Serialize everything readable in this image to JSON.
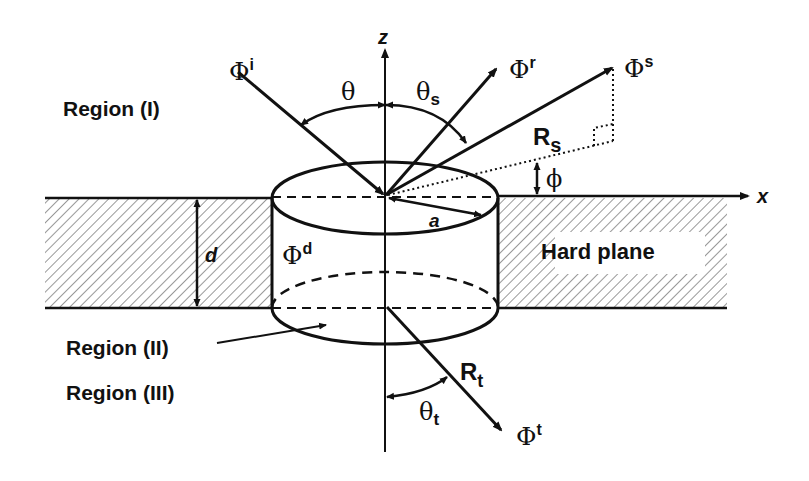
{
  "diagram": {
    "regions": {
      "upper": "Region (I)",
      "middle": "Region (II)",
      "lower": "Region (III)"
    },
    "plane_label": "Hard plane",
    "axes": {
      "z": "z",
      "x": "x"
    },
    "waves": {
      "incident": {
        "symbol": "Φ",
        "sup": "i"
      },
      "reflected": {
        "symbol": "Φ",
        "sup": "r"
      },
      "scattered": {
        "symbol": "Φ",
        "sup": "s"
      },
      "interior": {
        "symbol": "Φ",
        "sup": "d"
      },
      "transmitted": {
        "symbol": "Φ",
        "sup": "t"
      }
    },
    "angles": {
      "theta": "θ",
      "theta_s": {
        "symbol": "θ",
        "sub": "s"
      },
      "phi": "ϕ",
      "theta_t": {
        "symbol": "θ",
        "sub": "t"
      }
    },
    "distances": {
      "R_s": {
        "symbol": "R",
        "sub": "s"
      },
      "R_t": {
        "symbol": "R",
        "sub": "t"
      },
      "radius": "a",
      "thickness": "d"
    },
    "colors": {
      "stroke": "#111111",
      "hatch": "#333333",
      "background": "#ffffff"
    }
  }
}
